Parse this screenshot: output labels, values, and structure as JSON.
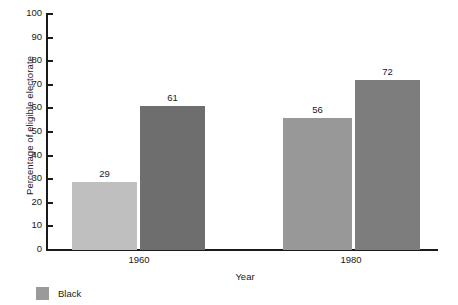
{
  "chart_data": {
    "type": "bar",
    "title": "",
    "xlabel": "Year",
    "ylabel": "Percentage of eligible electorate",
    "categories": [
      "1960",
      "1980"
    ],
    "series": [
      {
        "name": "Black",
        "values": [
          29,
          56
        ],
        "colors": [
          "#bfbfbf",
          "#989898"
        ]
      },
      {
        "name": "White",
        "values": [
          61,
          72
        ],
        "colors": [
          "#6e6e6e",
          "#7d7d7d"
        ]
      }
    ],
    "values_flat": [
      29,
      61,
      56,
      72
    ],
    "ylim": [
      0,
      100
    ],
    "yticks": [
      0,
      10,
      20,
      30,
      40,
      50,
      60,
      70,
      80,
      90,
      100
    ],
    "ytick_labels": [
      "0",
      "10",
      "20",
      "30",
      "40",
      "50",
      "60",
      "70",
      "80",
      "90",
      "100"
    ],
    "grid": false,
    "data_labels": true,
    "legend_position": "bottom-left",
    "legend": [
      {
        "label": "Black",
        "color": "#9a9a9a"
      }
    ]
  },
  "bars": [
    {
      "label": "29",
      "value": 29,
      "color": "#bfbfbf"
    },
    {
      "label": "61",
      "value": 61,
      "color": "#6e6e6e"
    },
    {
      "label": "56",
      "value": 56,
      "color": "#989898"
    },
    {
      "label": "72",
      "value": 72,
      "color": "#7d7d7d"
    }
  ],
  "axes": {
    "y_title": "Percentage of eligible electorate",
    "x_title": "Year",
    "y_ticks": [
      "100",
      "90",
      "80",
      "70",
      "60",
      "50",
      "40",
      "30",
      "20",
      "10",
      "0"
    ],
    "x_categories": [
      "1960",
      "1980"
    ]
  },
  "legend": {
    "entries": [
      {
        "label": "Black",
        "color": "#9a9a9a"
      }
    ]
  }
}
